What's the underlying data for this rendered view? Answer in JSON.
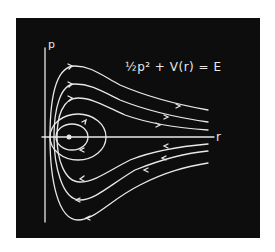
{
  "diagram": {
    "type": "phase-portrait",
    "axes": {
      "y_label": "p",
      "x_label": "r"
    },
    "equation": "½p² + V(r) = E",
    "fixed_point": "center",
    "curves": {
      "closed_orbits": 2,
      "open_trajectories": 6,
      "direction": "clockwise: right along upper branches toward +r at top, left along lower branches"
    },
    "colors": {
      "background": "#0d0d0d",
      "chalk": "#e8e8e8",
      "page": "#ffffff"
    }
  }
}
